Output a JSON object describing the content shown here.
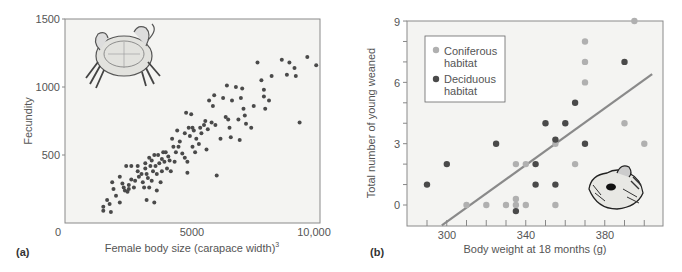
{
  "figure": {
    "panel_a_label": "(a)",
    "panel_b_label": "(b)"
  },
  "chart_data": [
    {
      "type": "scatter",
      "panel": "(a)",
      "title": "",
      "xlabel": "Female body size (carapace width)",
      "xlabel_superscript": "3",
      "ylabel": "Fecundity",
      "xlim": [
        0,
        10000
      ],
      "ylim": [
        0,
        1500
      ],
      "xticks": [
        "0",
        "5000",
        "10,000"
      ],
      "yticks": [
        "500",
        "1000",
        "1500"
      ],
      "grid": false,
      "illustration": "crab",
      "series": [
        {
          "name": "Female crabs",
          "color": "#4a4a4a",
          "points": [
            [
              1500,
              90
            ],
            [
              1500,
              120
            ],
            [
              1650,
              170
            ],
            [
              1750,
              140
            ],
            [
              1800,
              80
            ],
            [
              1850,
              300
            ],
            [
              1900,
              250
            ],
            [
              2000,
              200
            ],
            [
              2150,
              150
            ],
            [
              2150,
              340
            ],
            [
              2250,
              290
            ],
            [
              2300,
              260
            ],
            [
              2350,
              240
            ],
            [
              2400,
              420
            ],
            [
              2450,
              230
            ],
            [
              2500,
              280
            ],
            [
              2500,
              250
            ],
            [
              2600,
              420
            ],
            [
              2600,
              320
            ],
            [
              2700,
              260
            ],
            [
              2750,
              310
            ],
            [
              2850,
              420
            ],
            [
              2850,
              380
            ],
            [
              2900,
              340
            ],
            [
              3000,
              360
            ],
            [
              3050,
              300
            ],
            [
              3100,
              260
            ],
            [
              3150,
              440
            ],
            [
              3150,
              400
            ],
            [
              3200,
              360
            ],
            [
              3200,
              170
            ],
            [
              3250,
              330
            ],
            [
              3300,
              480
            ],
            [
              3300,
              260
            ],
            [
              3350,
              420
            ],
            [
              3400,
              460
            ],
            [
              3400,
              310
            ],
            [
              3450,
              380
            ],
            [
              3500,
              150
            ],
            [
              3500,
              500
            ],
            [
              3550,
              420
            ],
            [
              3600,
              360
            ],
            [
              3600,
              240
            ],
            [
              3650,
              500
            ],
            [
              3700,
              440
            ],
            [
              3750,
              300
            ],
            [
              3800,
              470
            ],
            [
              3800,
              380
            ],
            [
              3850,
              520
            ],
            [
              3900,
              450
            ],
            [
              3950,
              520
            ],
            [
              4000,
              400
            ],
            [
              4050,
              490
            ],
            [
              4100,
              460
            ],
            [
              4150,
              380
            ],
            [
              4200,
              620
            ],
            [
              4250,
              560
            ],
            [
              4300,
              450
            ],
            [
              4350,
              520
            ],
            [
              4400,
              680
            ],
            [
              4450,
              560
            ],
            [
              4500,
              600
            ],
            [
              4600,
              510
            ],
            [
              4700,
              660
            ],
            [
              4700,
              480
            ],
            [
              4750,
              810
            ],
            [
              4800,
              450
            ],
            [
              4800,
              370
            ],
            [
              4850,
              700
            ],
            [
              4900,
              640
            ],
            [
              4950,
              800
            ],
            [
              5000,
              560
            ],
            [
              5000,
              700
            ],
            [
              5050,
              680
            ],
            [
              5100,
              520
            ],
            [
              5150,
              620
            ],
            [
              5250,
              580
            ],
            [
              5300,
              700
            ],
            [
              5350,
              660
            ],
            [
              5450,
              720
            ],
            [
              5500,
              750
            ],
            [
              5550,
              540
            ],
            [
              5600,
              690
            ],
            [
              5650,
              900
            ],
            [
              5750,
              740
            ],
            [
              5800,
              860
            ],
            [
              5850,
              940
            ],
            [
              5900,
              720
            ],
            [
              5950,
              350
            ],
            [
              6100,
              620
            ],
            [
              6200,
              920
            ],
            [
              6300,
              780
            ],
            [
              6350,
              1010
            ],
            [
              6400,
              760
            ],
            [
              6450,
              700
            ],
            [
              6500,
              630
            ],
            [
              6550,
              900
            ],
            [
              6700,
              1000
            ],
            [
              6800,
              760
            ],
            [
              6850,
              610
            ],
            [
              6900,
              920
            ],
            [
              6950,
              990
            ],
            [
              7000,
              840
            ],
            [
              7050,
              790
            ],
            [
              7100,
              730
            ],
            [
              7300,
              700
            ],
            [
              7400,
              860
            ],
            [
              7550,
              1180
            ],
            [
              7700,
              1050
            ],
            [
              7800,
              980
            ],
            [
              7800,
              930
            ],
            [
              7850,
              840
            ],
            [
              8000,
              900
            ],
            [
              8100,
              1080
            ],
            [
              8500,
              1200
            ],
            [
              8700,
              1090
            ],
            [
              8800,
              1180
            ],
            [
              9000,
              1140
            ],
            [
              9050,
              1080
            ],
            [
              9200,
              740
            ],
            [
              9500,
              1220
            ],
            [
              9850,
              1160
            ]
          ]
        }
      ]
    },
    {
      "type": "scatter",
      "panel": "(b)",
      "title": "",
      "xlabel": "Body weight at 18 months (g)",
      "ylabel": "Total number of young weaned",
      "xlim": [
        280,
        410
      ],
      "ylim": [
        -1,
        9
      ],
      "xticks": [
        "300",
        "340",
        "380"
      ],
      "yticks": [
        "0",
        "3",
        "6",
        "9"
      ],
      "grid": false,
      "illustration": "squirrel",
      "legend": {
        "position": "upper-left",
        "entries": [
          {
            "label_line1": "Coniferous",
            "label_line2": "habitat",
            "color": "#b0b0b0"
          },
          {
            "label_line1": "Deciduous",
            "label_line2": "habitat",
            "color": "#4a4a4a"
          }
        ]
      },
      "series": [
        {
          "name": "Coniferous habitat",
          "color": "#b0b0b0",
          "points": [
            [
              310,
              0
            ],
            [
              320,
              0
            ],
            [
              330,
              0
            ],
            [
              335,
              0
            ],
            [
              335,
              0.3
            ],
            [
              335,
              2
            ],
            [
              340,
              2
            ],
            [
              340,
              0
            ],
            [
              355,
              3
            ],
            [
              355,
              0
            ],
            [
              365,
              2
            ],
            [
              370,
              8
            ],
            [
              370,
              7
            ],
            [
              370,
              6
            ],
            [
              390,
              4
            ],
            [
              395,
              9
            ],
            [
              400,
              3
            ]
          ]
        },
        {
          "name": "Deciduous habitat",
          "color": "#4a4a4a",
          "points": [
            [
              290,
              1
            ],
            [
              300,
              2
            ],
            [
              325,
              3
            ],
            [
              335,
              -0.3
            ],
            [
              345,
              2
            ],
            [
              345,
              1
            ],
            [
              350,
              4
            ],
            [
              355,
              3.2
            ],
            [
              355,
              1
            ],
            [
              360,
              4
            ],
            [
              365,
              5
            ],
            [
              370,
              3
            ],
            [
              390,
              7
            ]
          ]
        }
      ],
      "regression_line": {
        "color": "#8a8a8a",
        "from": [
          297.5,
          -1
        ],
        "to": [
          404,
          6.4
        ]
      }
    }
  ]
}
